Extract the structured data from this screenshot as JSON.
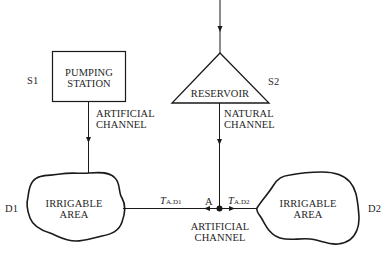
{
  "diagram": {
    "nodes": {
      "s1": {
        "id": "S1",
        "line1": "PUMPING",
        "line2": "STATION",
        "shape": "rectangle"
      },
      "s2": {
        "id": "S2",
        "label": "RESERVOIR",
        "shape": "triangle"
      },
      "d1": {
        "id": "D1",
        "line1": "IRRIGABLE",
        "line2": "AREA",
        "shape": "blob"
      },
      "d2": {
        "id": "D2",
        "line1": "IRRIGABLE",
        "line2": "AREA",
        "shape": "blob"
      },
      "a": {
        "id": "A",
        "shape": "junction-dot"
      }
    },
    "edges": {
      "s1_d1": {
        "line1": "ARTIFICIAL",
        "line2": "CHANNEL"
      },
      "s2_a": {
        "line1": "NATURAL",
        "line2": "CHANNEL"
      },
      "a_d": {
        "line1": "ARTIFICIAL",
        "line2": "CHANNEL"
      },
      "t_ad1": {
        "symbol": "T",
        "subscript": "A.D1"
      },
      "t_ad2": {
        "symbol": "T",
        "subscript": "A.D2"
      }
    },
    "colors": {
      "stroke": "#1a1a1a",
      "background": "#ffffff"
    }
  }
}
